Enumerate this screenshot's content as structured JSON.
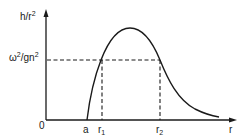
{
  "diagram": {
    "y_axis_label": {
      "base": "h/r",
      "exp": "2"
    },
    "level_label": {
      "base1": "ω",
      "exp1": "2",
      "mid": "/gn",
      "exp2": "2"
    },
    "origin_label": "0",
    "x_axis_label": "r",
    "x_ticks": [
      {
        "label": "a",
        "sub": ""
      },
      {
        "label": "r",
        "sub": "1"
      },
      {
        "label": "r",
        "sub": "2"
      }
    ],
    "colors": {
      "line": "#1a1a1a",
      "background": "#ffffff"
    }
  }
}
